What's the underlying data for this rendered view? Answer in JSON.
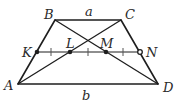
{
  "figure": {
    "colors": {
      "line": "#1e1e1e",
      "text": "#2a2a2a",
      "background": "#ffffff"
    },
    "points": {
      "A": {
        "label": "A",
        "x": 18,
        "y": 84
      },
      "B": {
        "label": "B",
        "x": 55,
        "y": 20
      },
      "C": {
        "label": "C",
        "x": 121,
        "y": 20
      },
      "D": {
        "label": "D",
        "x": 158,
        "y": 84
      },
      "K": {
        "label": "K",
        "x": 37,
        "y": 52
      },
      "L": {
        "label": "L",
        "x": 70,
        "y": 52
      },
      "M": {
        "label": "M",
        "x": 106,
        "y": 52
      },
      "N": {
        "label": "N",
        "x": 140,
        "y": 52
      }
    },
    "side_labels": {
      "top": "a",
      "bottom": "b"
    },
    "segments": [
      "AB",
      "BC",
      "CD",
      "DA",
      "AC",
      "BD",
      "KN"
    ],
    "tick_marks": [
      "KL",
      "LM",
      "MN"
    ]
  }
}
